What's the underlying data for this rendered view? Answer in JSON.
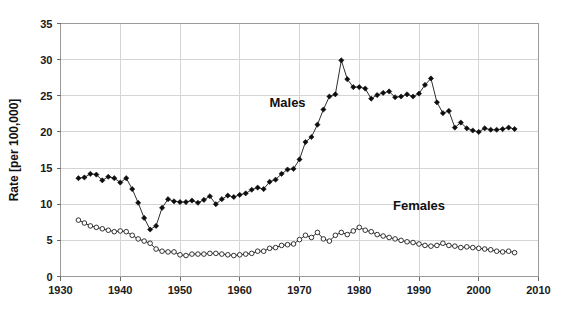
{
  "chart_data": {
    "type": "line",
    "title": "",
    "xlabel": "",
    "ylabel": "Rate [per 100,000]",
    "xlim": [
      1930,
      2010
    ],
    "ylim": [
      0,
      35
    ],
    "xticks": [
      1930,
      1940,
      1950,
      1960,
      1970,
      1980,
      1990,
      2000,
      2010
    ],
    "yticks": [
      0,
      5,
      10,
      15,
      20,
      25,
      30,
      35
    ],
    "grid": true,
    "legend_position": "inline-annotations",
    "annotations": [
      {
        "text": "Males",
        "x": 1968,
        "y": 23.5
      },
      {
        "text": "Females",
        "x": 1990,
        "y": 9.2
      }
    ],
    "x": [
      1933,
      1934,
      1935,
      1936,
      1937,
      1938,
      1939,
      1940,
      1941,
      1942,
      1943,
      1944,
      1945,
      1946,
      1947,
      1948,
      1949,
      1950,
      1951,
      1952,
      1953,
      1954,
      1955,
      1956,
      1957,
      1958,
      1959,
      1960,
      1961,
      1962,
      1963,
      1964,
      1965,
      1966,
      1967,
      1968,
      1969,
      1970,
      1971,
      1972,
      1973,
      1974,
      1975,
      1976,
      1977,
      1978,
      1979,
      1980,
      1981,
      1982,
      1983,
      1984,
      1985,
      1986,
      1987,
      1988,
      1989,
      1990,
      1991,
      1992,
      1993,
      1994,
      1995,
      1996,
      1997,
      1998,
      1999,
      2000,
      2001,
      2002,
      2003,
      2004,
      2005,
      2006
    ],
    "series": [
      {
        "name": "Males",
        "marker": "filled-diamond",
        "values": [
          13.6,
          13.7,
          14.2,
          14.1,
          13.3,
          13.8,
          13.6,
          13.0,
          13.6,
          12.1,
          10.2,
          8.1,
          6.5,
          7.0,
          9.5,
          10.7,
          10.4,
          10.3,
          10.3,
          10.5,
          10.2,
          10.6,
          11.1,
          10.0,
          10.7,
          11.2,
          11.0,
          11.3,
          11.5,
          12.0,
          12.3,
          12.1,
          13.1,
          13.4,
          14.2,
          14.8,
          14.9,
          16.2,
          18.6,
          19.3,
          21.0,
          23.1,
          24.9,
          25.2,
          29.9,
          27.3,
          26.2,
          26.2,
          26.0,
          24.6,
          25.1,
          25.4,
          25.6,
          24.8,
          24.9,
          25.2,
          24.9,
          25.3,
          26.5,
          27.4,
          24.1,
          22.6,
          22.9,
          20.6,
          21.3,
          20.5,
          20.2,
          20.0,
          20.5,
          20.3,
          20.3,
          20.4,
          20.6,
          20.4
        ]
      },
      {
        "name": "Females",
        "marker": "open-circle",
        "values": [
          7.8,
          7.4,
          7.0,
          6.8,
          6.6,
          6.4,
          6.2,
          6.3,
          6.2,
          5.7,
          5.2,
          4.9,
          4.6,
          3.8,
          3.5,
          3.4,
          3.4,
          3.0,
          2.9,
          3.1,
          3.1,
          3.1,
          3.2,
          3.2,
          3.1,
          3.0,
          2.9,
          3.0,
          3.1,
          3.2,
          3.5,
          3.5,
          3.9,
          4.0,
          4.3,
          4.4,
          4.5,
          5.1,
          5.7,
          5.4,
          6.1,
          5.2,
          4.9,
          5.7,
          6.1,
          5.8,
          6.3,
          6.8,
          6.4,
          6.2,
          5.8,
          5.6,
          5.4,
          5.2,
          5.0,
          4.8,
          4.7,
          4.5,
          4.3,
          4.2,
          4.3,
          4.6,
          4.3,
          4.2,
          4.0,
          4.1,
          4.0,
          3.9,
          3.8,
          3.7,
          3.5,
          3.4,
          3.5,
          3.3
        ]
      }
    ]
  },
  "colors": {
    "line": "#161616",
    "grid": "#d4d4d4",
    "frame": "#9a9a9a",
    "text": "#111111",
    "background": "#ffffff"
  }
}
